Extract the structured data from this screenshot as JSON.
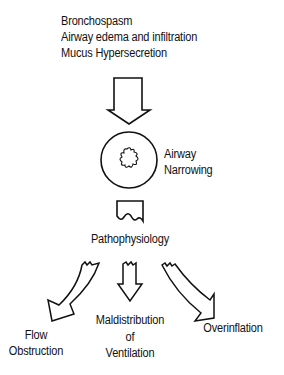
{
  "causes": [
    "Bronchospasm",
    "Airway edema and infiltration",
    "Mucus Hypersecretion"
  ],
  "airway": {
    "label_line1": "Airway",
    "label_line2": "Narrowing"
  },
  "center_node": {
    "label": "Pathophysiology"
  },
  "outcomes": {
    "left": {
      "line1": "Flow",
      "line2": "Obstruction"
    },
    "middle": {
      "line1": "Maldistribution",
      "line2": "of",
      "line3": "Ventilation"
    },
    "right": {
      "line1": "Overinflation"
    }
  },
  "colors": {
    "ink": "#111111",
    "background": "#ffffff"
  }
}
